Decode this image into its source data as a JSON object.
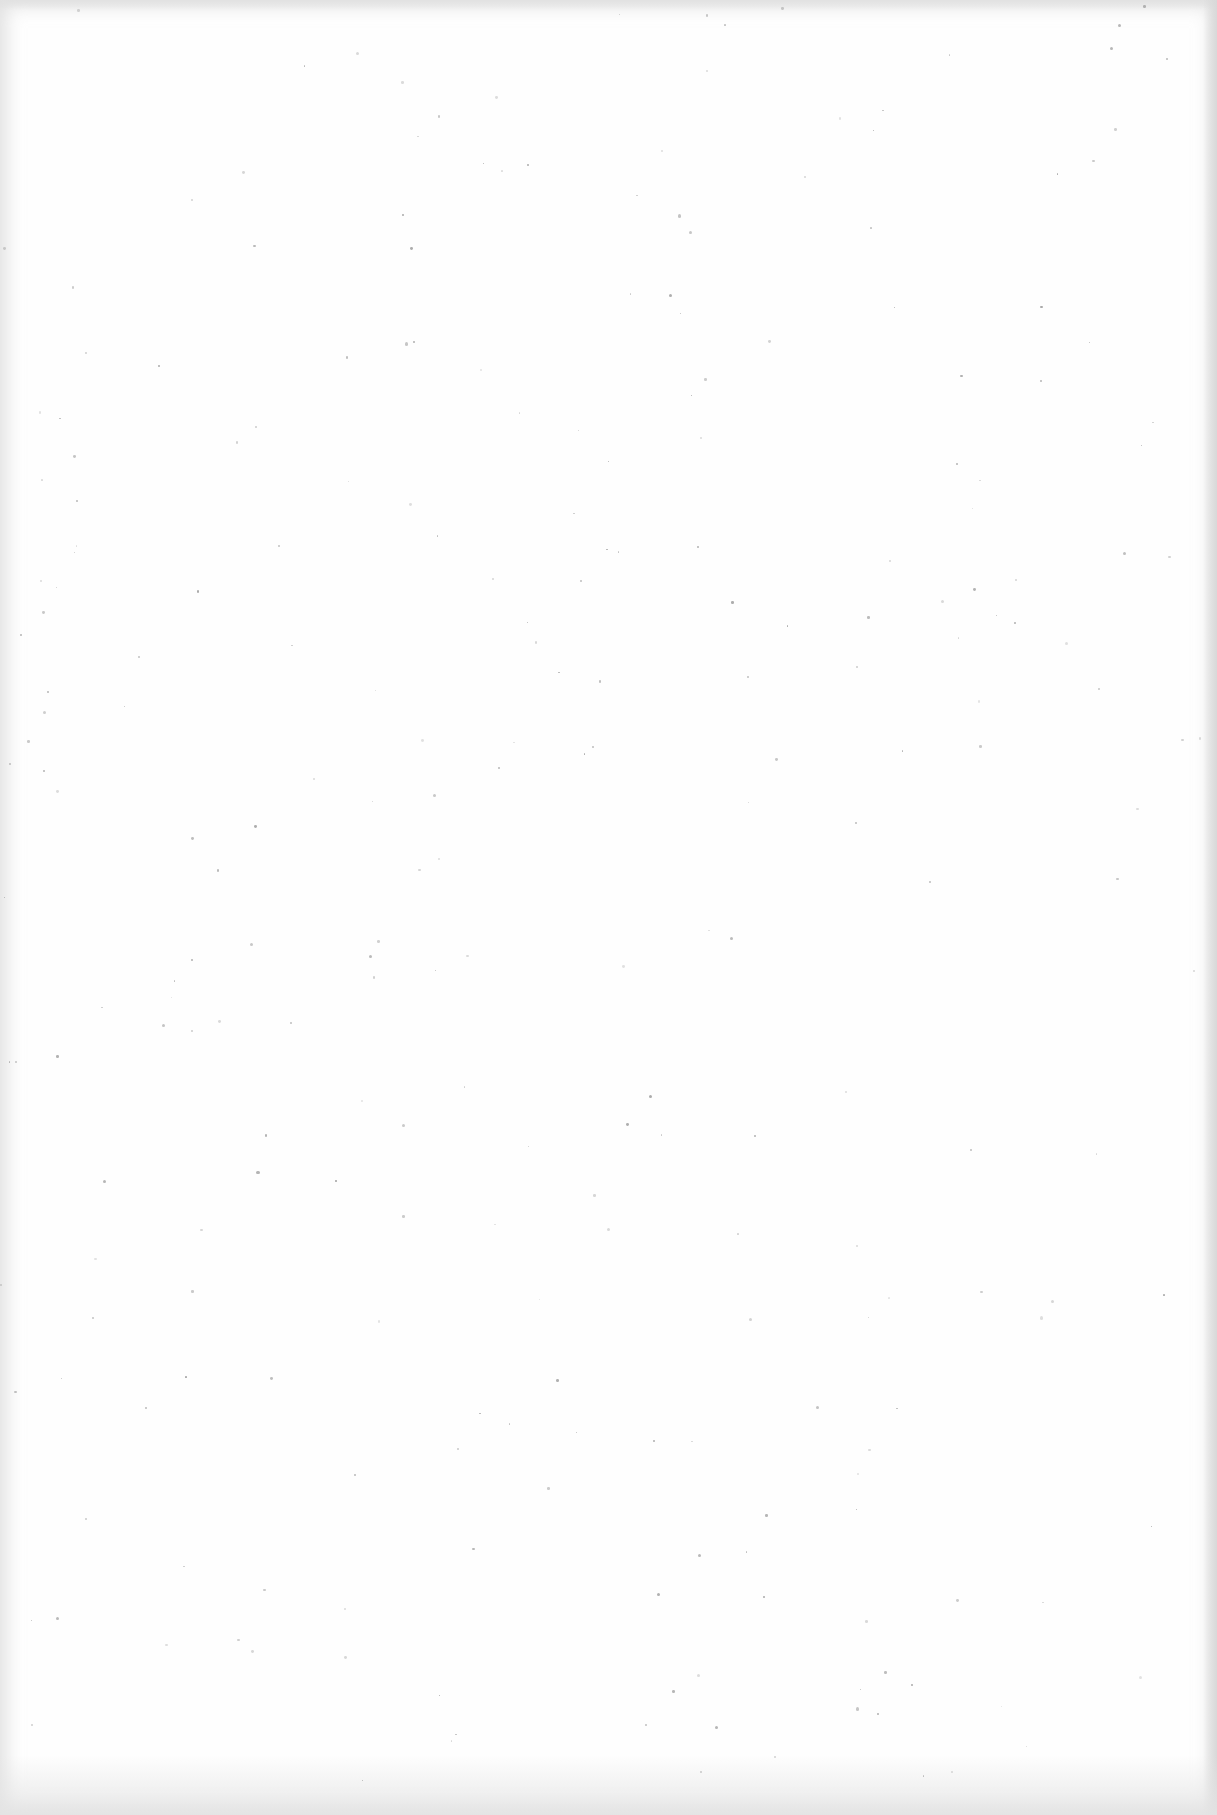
{
  "document": {
    "type": "blank-scanned-page",
    "text_content": "",
    "background_color": "#fefefe",
    "edge_shade_color": "#d7d7d7",
    "speck_color": "#9a9a9a"
  }
}
